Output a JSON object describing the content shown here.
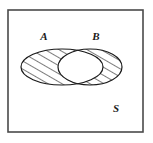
{
  "figure": {
    "type": "venn-diagram",
    "title": "",
    "background_color": "#ffffff",
    "stroke_color": "#1a1a1a",
    "hatch_color": "#1a1a1a"
  },
  "universal_set": {
    "label": "S",
    "label_x": 116,
    "label_y": 112,
    "rect": {
      "x": 8,
      "y": 10,
      "width": 135,
      "height": 122
    },
    "border_color": "#4a4a4a",
    "border_width": 1.6
  },
  "sets": [
    {
      "id": "A",
      "label": "A",
      "label_x": 44,
      "label_y": 40,
      "cx": 62,
      "cy": 67,
      "rx": 41,
      "ry": 18,
      "hatched": true,
      "hatch_angle_deg": 60,
      "hatch_spacing": 7,
      "stroke_width": 1.2
    },
    {
      "id": "B",
      "label": "B",
      "label_x": 96,
      "label_y": 40,
      "cx": 90,
      "cy": 67,
      "rx": 32,
      "ry": 18,
      "hatched": true,
      "hatch_angle_deg": 60,
      "hatch_spacing": 7,
      "stroke_width": 1.2
    }
  ],
  "intersection": {
    "id": "A-and-B",
    "hatched": false,
    "fill": "#ffffff",
    "note": "A ∩ B region left unshaded"
  }
}
